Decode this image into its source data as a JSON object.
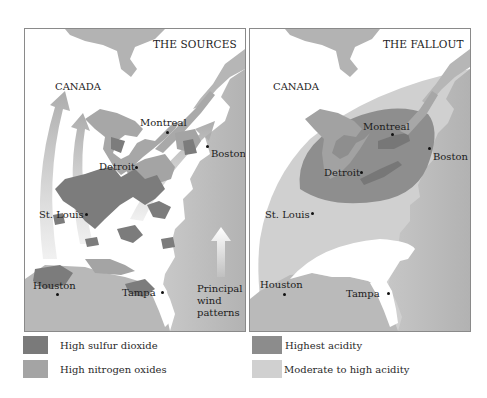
{
  "panels": {
    "left": {
      "title": "THE SOURCES",
      "region_label": "CANADA",
      "cities": {
        "montreal": "Montreal",
        "detroit": "Detroit",
        "boston": "Boston",
        "st_louis": "St. Louis",
        "houston": "Houston",
        "tampa": "Tampa"
      },
      "wind_note": {
        "line1": "Principal",
        "line2": "wind",
        "line3": "patterns",
        "icon": "up-arrow-icon"
      }
    },
    "right": {
      "title": "THE FALLOUT",
      "region_label": "CANADA",
      "cities": {
        "montreal": "Montreal",
        "detroit": "Detroit",
        "boston": "Boston",
        "st_louis": "St. Louis",
        "houston": "Houston",
        "tampa": "Tampa"
      }
    }
  },
  "legend": {
    "left": [
      {
        "label": "High sulfur dioxide",
        "color": "#7a7a7a"
      },
      {
        "label": "High nitrogen oxides",
        "color": "#a4a4a4"
      }
    ],
    "right": [
      {
        "label": "Highest acidity",
        "color": "#8c8c8c"
      },
      {
        "label": "Moderate to high acidity",
        "color": "#d0d0d0"
      }
    ]
  },
  "colors": {
    "ocean": "#b9b9b9",
    "land": "#ffffff",
    "lakes": "#a3a3a3",
    "sulfur": "#7a7a7a",
    "nitrogen": "#a4a4a4",
    "highest_acidity": "#8c8c8c",
    "moderate_acidity": "#d0d0d0"
  }
}
